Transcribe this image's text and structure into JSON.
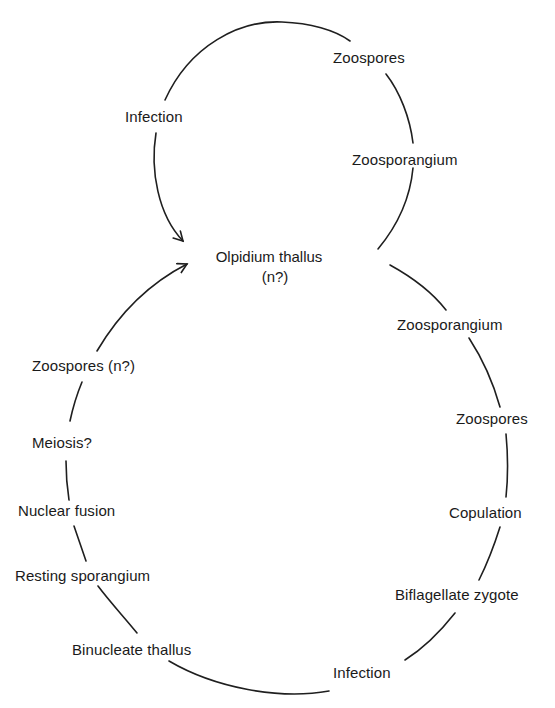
{
  "diagram": {
    "type": "life-cycle",
    "center": {
      "title": "Olpidium thallus",
      "ploidy": "(n?)"
    },
    "asexual_cycle": {
      "stages": [
        {
          "id": "infection-top",
          "label": "Infection"
        },
        {
          "id": "zoospores-top",
          "label": "Zoospores"
        },
        {
          "id": "zoosporangium-top",
          "label": "Zoosporangium"
        }
      ]
    },
    "sexual_cycle": {
      "stages": [
        {
          "id": "zoosporangium-right",
          "label": "Zoosporangium"
        },
        {
          "id": "zoospores-right",
          "label": "Zoospores"
        },
        {
          "id": "copulation",
          "label": "Copulation"
        },
        {
          "id": "biflagellate-zygote",
          "label": "Biflagellate zygote"
        },
        {
          "id": "infection-bottom",
          "label": "Infection"
        },
        {
          "id": "binucleate-thallus",
          "label": "Binucleate thallus"
        },
        {
          "id": "resting-sporangium",
          "label": "Resting sporangium"
        },
        {
          "id": "nuclear-fusion",
          "label": "Nuclear fusion"
        },
        {
          "id": "meiosis",
          "label": "Meiosis?"
        },
        {
          "id": "zoospores-haploid",
          "label": "Zoospores (n?)"
        }
      ]
    }
  }
}
